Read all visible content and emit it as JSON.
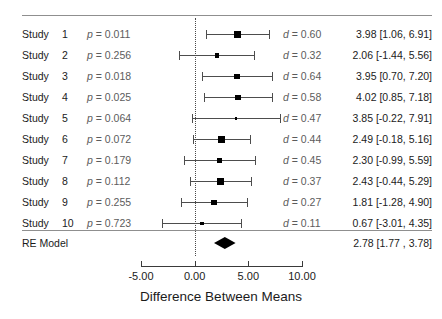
{
  "chart_data": {
    "type": "forest",
    "title": "",
    "xlabel": "Difference Between Means",
    "ylabel": "",
    "xlim": [
      -7.0,
      11.0
    ],
    "axis_ticks": [
      -5.0,
      0.0,
      5.0,
      10.0
    ],
    "axis_tick_labels": [
      "-5.00",
      "0.00",
      "5.00",
      "10.00"
    ],
    "reference_line": 0.0,
    "grid": false,
    "legend": "none",
    "columns": {
      "study": "Study",
      "pvalue": "p",
      "effect": "d",
      "estimate": "Estimate [95% CI]"
    },
    "studies": [
      {
        "label": "Study",
        "number": "1",
        "p_text": "p = 0.011",
        "p": 0.011,
        "d_text": "d = 0.60",
        "d": 0.6,
        "estimate_text": "3.98 [1.06, 6.91]",
        "estimate": 3.98,
        "ci_low": 1.06,
        "ci_high": 6.91
      },
      {
        "label": "Study",
        "number": "2",
        "p_text": "p = 0.256",
        "p": 0.256,
        "d_text": "d = 0.32",
        "d": 0.32,
        "estimate_text": "2.06 [-1.44, 5.56]",
        "estimate": 2.06,
        "ci_low": -1.44,
        "ci_high": 5.56
      },
      {
        "label": "Study",
        "number": "3",
        "p_text": "p = 0.018",
        "p": 0.018,
        "d_text": "d = 0.64",
        "d": 0.64,
        "estimate_text": "3.95 [0.70, 7.20]",
        "estimate": 3.95,
        "ci_low": 0.7,
        "ci_high": 7.2
      },
      {
        "label": "Study",
        "number": "4",
        "p_text": "p = 0.025",
        "p": 0.025,
        "d_text": "d = 0.58",
        "d": 0.58,
        "estimate_text": "4.02 [0.85, 7.18]",
        "estimate": 4.02,
        "ci_low": 0.85,
        "ci_high": 7.18
      },
      {
        "label": "Study",
        "number": "5",
        "p_text": "p = 0.064",
        "p": 0.064,
        "d_text": "d = 0.47",
        "d": 0.47,
        "estimate_text": "3.85 [-0.22, 7.91]",
        "estimate": 3.85,
        "ci_low": -0.22,
        "ci_high": 7.91
      },
      {
        "label": "Study",
        "number": "6",
        "p_text": "p = 0.072",
        "p": 0.072,
        "d_text": "d = 0.44",
        "d": 0.44,
        "estimate_text": "2.49 [-0.18, 5.16]",
        "estimate": 2.49,
        "ci_low": -0.18,
        "ci_high": 5.16
      },
      {
        "label": "Study",
        "number": "7",
        "p_text": "p = 0.179",
        "p": 0.179,
        "d_text": "d = 0.45",
        "d": 0.45,
        "estimate_text": "2.30 [-0.99, 5.59]",
        "estimate": 2.3,
        "ci_low": -0.99,
        "ci_high": 5.59
      },
      {
        "label": "Study",
        "number": "8",
        "p_text": "p = 0.112",
        "p": 0.112,
        "d_text": "d = 0.37",
        "d": 0.37,
        "estimate_text": "2.43 [-0.44, 5.29]",
        "estimate": 2.43,
        "ci_low": -0.44,
        "ci_high": 5.29
      },
      {
        "label": "Study",
        "number": "9",
        "p_text": "p = 0.255",
        "p": 0.255,
        "d_text": "d = 0.27",
        "d": 0.27,
        "estimate_text": "1.81 [-1.28, 4.90]",
        "estimate": 1.81,
        "ci_low": -1.28,
        "ci_high": 4.9
      },
      {
        "label": "Study",
        "number": "10",
        "p_text": "p = 0.723",
        "p": 0.723,
        "d_text": "d = 0.11",
        "d": 0.11,
        "estimate_text": "0.67 [-3.01, 4.35]",
        "estimate": 0.67,
        "ci_low": -3.01,
        "ci_high": 4.35
      }
    ],
    "summary": {
      "label": "RE Model",
      "estimate_text": "2.78 [1.77 , 3.78]",
      "estimate": 2.78,
      "ci_low": 1.77,
      "ci_high": 3.78
    },
    "colors": {
      "marker": "#000000",
      "line": "#4d4d4d",
      "rule": "#8f8f8f",
      "reference": "#4a4a4a",
      "text": "#1b1b1b",
      "muted_text": "#5c5c5c"
    }
  }
}
